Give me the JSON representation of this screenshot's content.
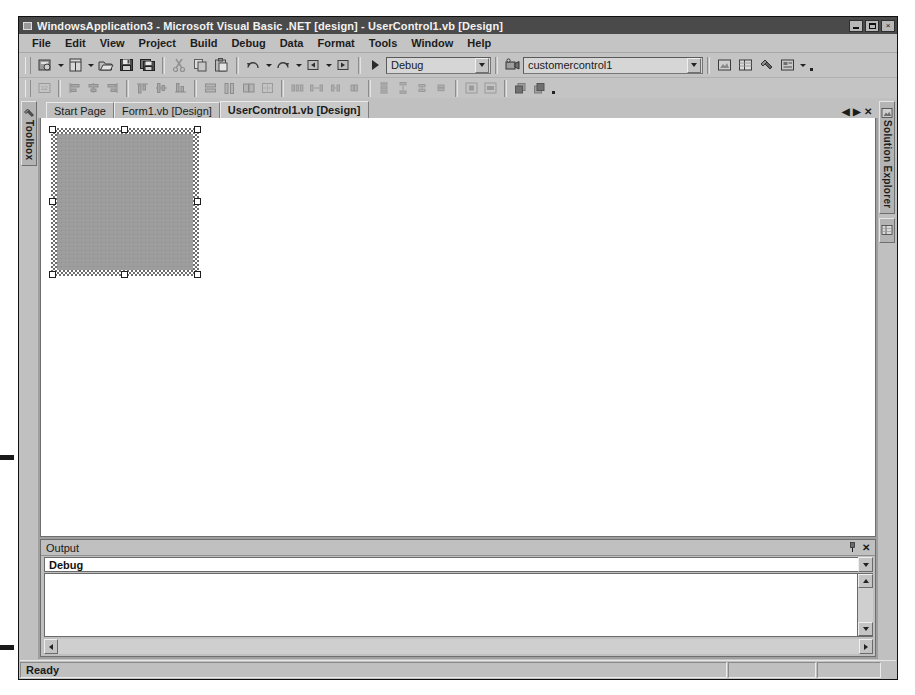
{
  "window": {
    "title": "WindowsApplication3 - Microsoft Visual Basic .NET [design] - UserControl1.vb [Design]",
    "app_icon": "vb-project-icon",
    "minimize_label": "_",
    "restore_label": "",
    "close_label": "×"
  },
  "menu": {
    "items": [
      {
        "label": "File",
        "accel": "F"
      },
      {
        "label": "Edit",
        "accel": "E"
      },
      {
        "label": "View",
        "accel": "V"
      },
      {
        "label": "Project",
        "accel": "P"
      },
      {
        "label": "Build",
        "accel": "B"
      },
      {
        "label": "Debug",
        "accel": "D"
      },
      {
        "label": "Data",
        "accel": "a"
      },
      {
        "label": "Format",
        "accel": "o"
      },
      {
        "label": "Tools",
        "accel": "T"
      },
      {
        "label": "Window",
        "accel": "W"
      },
      {
        "label": "Help",
        "accel": "H"
      }
    ]
  },
  "toolbar_standard": {
    "buttons": [
      {
        "name": "new-project-icon",
        "tooltip": "New Project"
      },
      {
        "name": "add-new-item-icon",
        "tooltip": "Add New Item"
      },
      {
        "name": "open-file-icon",
        "tooltip": "Open File"
      },
      {
        "name": "save-icon",
        "tooltip": "Save UserControl1.vb"
      },
      {
        "name": "save-all-icon",
        "tooltip": "Save All"
      },
      {
        "name": "cut-icon",
        "tooltip": "Cut"
      },
      {
        "name": "copy-icon",
        "tooltip": "Copy"
      },
      {
        "name": "paste-icon",
        "tooltip": "Paste"
      },
      {
        "name": "undo-icon",
        "tooltip": "Undo"
      },
      {
        "name": "redo-icon",
        "tooltip": "Redo"
      },
      {
        "name": "navigate-back-icon",
        "tooltip": "Navigate Backward"
      },
      {
        "name": "navigate-forward-icon",
        "tooltip": "Navigate Forward"
      }
    ],
    "start_label": "Start",
    "solution_config": {
      "value": "Debug",
      "options": [
        "Debug",
        "Release"
      ]
    },
    "find_target": {
      "value": "customercontrol1",
      "options": [
        "customercontrol1"
      ]
    },
    "right_buttons": [
      {
        "name": "solution-explorer-icon",
        "tooltip": "Solution Explorer"
      },
      {
        "name": "properties-window-icon",
        "tooltip": "Properties Window"
      },
      {
        "name": "toolbox-icon",
        "tooltip": "Toolbox"
      },
      {
        "name": "class-view-icon",
        "tooltip": "Class View"
      }
    ]
  },
  "toolbar_layout": {
    "buttons": [
      {
        "name": "tab-order-icon",
        "tooltip": "Tab Order"
      },
      {
        "name": "align-lefts-icon",
        "tooltip": "Align Lefts"
      },
      {
        "name": "align-centers-icon",
        "tooltip": "Align Centers"
      },
      {
        "name": "align-rights-icon",
        "tooltip": "Align Rights"
      },
      {
        "name": "align-tops-icon",
        "tooltip": "Align Tops"
      },
      {
        "name": "align-middles-icon",
        "tooltip": "Align Middles"
      },
      {
        "name": "align-bottoms-icon",
        "tooltip": "Align Bottoms"
      },
      {
        "name": "make-same-width-icon",
        "tooltip": "Make Same Width"
      },
      {
        "name": "make-same-height-icon",
        "tooltip": "Make Same Height"
      },
      {
        "name": "make-same-size-icon",
        "tooltip": "Make Same Size"
      },
      {
        "name": "size-to-grid-icon",
        "tooltip": "Size to Grid"
      },
      {
        "name": "make-horizontal-spacing-equal-icon",
        "tooltip": "Make Horizontal Spacing Equal"
      },
      {
        "name": "increase-horizontal-spacing-icon",
        "tooltip": "Increase Horizontal Spacing"
      },
      {
        "name": "decrease-horizontal-spacing-icon",
        "tooltip": "Decrease Horizontal Spacing"
      },
      {
        "name": "remove-horizontal-spacing-icon",
        "tooltip": "Remove Horizontal Spacing"
      },
      {
        "name": "make-vertical-spacing-equal-icon",
        "tooltip": "Make Vertical Spacing Equal"
      },
      {
        "name": "increase-vertical-spacing-icon",
        "tooltip": "Increase Vertical Spacing"
      },
      {
        "name": "decrease-vertical-spacing-icon",
        "tooltip": "Decrease Vertical Spacing"
      },
      {
        "name": "remove-vertical-spacing-icon",
        "tooltip": "Remove Vertical Spacing"
      },
      {
        "name": "center-horizontally-icon",
        "tooltip": "Center Horizontally"
      },
      {
        "name": "center-vertically-icon",
        "tooltip": "Center Vertically"
      },
      {
        "name": "bring-to-front-icon",
        "tooltip": "Bring to Front"
      },
      {
        "name": "send-to-back-icon",
        "tooltip": "Send to Back"
      }
    ]
  },
  "left_dock": {
    "tabs": [
      {
        "label": "Toolbox",
        "icon": "toolbox-icon"
      }
    ]
  },
  "right_dock": {
    "tabs": [
      {
        "label": "Solution Explorer",
        "icon": "solution-explorer-icon"
      },
      {
        "label": "",
        "icon": "properties-window-icon"
      }
    ]
  },
  "document_tabs": {
    "items": [
      {
        "label": "Start Page",
        "active": false
      },
      {
        "label": "Form1.vb [Design]",
        "active": false
      },
      {
        "label": "UserControl1.vb [Design]",
        "active": true
      }
    ],
    "nav_prev": "◀",
    "nav_next": "▶",
    "close": "✕"
  },
  "designer": {
    "control_name": "UserControl1",
    "selected": true,
    "handles": [
      "nw",
      "n",
      "ne",
      "w",
      "e",
      "sw",
      "s",
      "se"
    ]
  },
  "output_panel": {
    "title": "Output",
    "pin_icon": "auto-hide-pin-icon",
    "close_icon": "close-icon",
    "source": {
      "value": "Debug",
      "options": [
        "Debug",
        "Build"
      ]
    },
    "text": ""
  },
  "status_bar": {
    "message": "Ready",
    "cells": [
      "",
      ""
    ]
  }
}
